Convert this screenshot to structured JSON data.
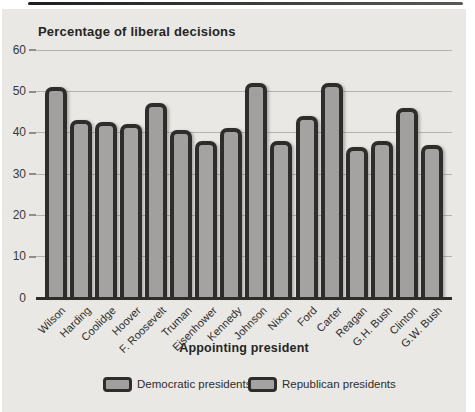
{
  "figure": {
    "title": "Percentage of liberal decisions",
    "x_axis_title": "Appointing president"
  },
  "legend": {
    "items": [
      {
        "label": "Democratic presidents",
        "party": "democratic"
      },
      {
        "label": "Republican presidents",
        "party": "republican"
      }
    ]
  },
  "colors": {
    "page_bg": "#ffffff",
    "panel_bg": "#e9e8e4",
    "bar_fill_democratic": "#a1a09e",
    "bar_fill_republican": "#a4a3a1",
    "bar_outline": "#2e2d2b",
    "gridline": "#b3b2ae",
    "text": "#2e2d2b"
  },
  "chart_data": {
    "type": "bar",
    "title": "Percentage of liberal decisions",
    "xlabel": "Appointing president",
    "ylabel": "Percentage of liberal decisions",
    "ylim": [
      0,
      60
    ],
    "y_ticks": [
      0,
      10,
      20,
      30,
      40,
      50,
      60
    ],
    "grid": true,
    "legend_position": "bottom",
    "categories": [
      "Wilson",
      "Harding",
      "Coolidge",
      "Hoover",
      "F. Roosevelt",
      "Truman",
      "Eisenhower",
      "Kennedy",
      "Johnson",
      "Nixon",
      "Ford",
      "Carter",
      "Reagan",
      "G.H. Bush",
      "Clinton",
      "G.W. Bush"
    ],
    "values": [
      51,
      43,
      42.5,
      42,
      47,
      40.5,
      38,
      41,
      52,
      38,
      44,
      52,
      36.5,
      38,
      46,
      37
    ],
    "parties": [
      "democratic",
      "republican",
      "republican",
      "republican",
      "democratic",
      "democratic",
      "republican",
      "democratic",
      "democratic",
      "republican",
      "republican",
      "democratic",
      "republican",
      "republican",
      "democratic",
      "republican"
    ]
  }
}
